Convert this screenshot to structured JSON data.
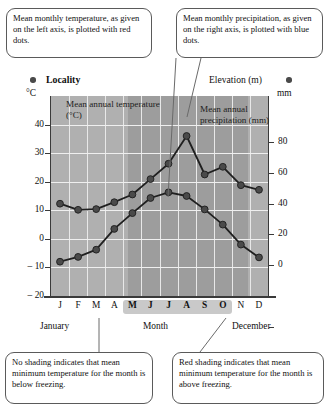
{
  "callouts": {
    "temperature": "Mean monthly temperature, as given on the left axis, is plotted with red dots.",
    "precipitation": "Mean monthly precipitation, as given on the right axis, is plotted with blue dots.",
    "no_shading": "No shading indicates that mean minimum temperature for the month is below freezing.",
    "red_shading": "Red shading indicates that mean minimum temperature for the month is above freezing."
  },
  "header": {
    "locality": "Locality",
    "elevation": "Elevation (m)",
    "left_unit": "°C",
    "right_unit": "mm",
    "left_dot": "red-dot-marker",
    "right_dot": "blue-dot-marker"
  },
  "series_labels": {
    "temperature": "Mean annual temperature (°C)",
    "precipitation": "Mean annual precipitation (mm)"
  },
  "axis_captions": {
    "first": "January",
    "middle": "Month",
    "last": "December"
  },
  "colors": {
    "plot_background": "#b0b0b0",
    "red_shading_band": "#9d9d9d",
    "gridlines": "#e8e8e8",
    "axis": "#3a3a3a",
    "marker": "#4a4a4a",
    "line": "#1f1f1f",
    "callout_border": "#5a5a5a",
    "month_band": "#c9c9c9"
  },
  "chart_data": {
    "type": "line",
    "xlabel": "Month",
    "grid": true,
    "legend": "inline-annotations",
    "categories": [
      "J",
      "F",
      "M",
      "A",
      "M",
      "J",
      "J",
      "A",
      "S",
      "O",
      "N",
      "D"
    ],
    "category_names": [
      "January",
      "February",
      "March",
      "April",
      "May",
      "June",
      "July",
      "August",
      "September",
      "October",
      "November",
      "December"
    ],
    "shaded_months": [
      "M",
      "J",
      "J",
      "A",
      "S",
      "O"
    ],
    "shaded_month_names": [
      "May",
      "June",
      "July",
      "August",
      "September",
      "October"
    ],
    "axes": {
      "left": {
        "label": "°C",
        "ylim": [
          -20,
          50
        ],
        "ticks": [
          40,
          30,
          20,
          10,
          0,
          -10,
          -20
        ],
        "tick_labels": [
          "40",
          "30",
          "20",
          "10",
          "0",
          "– 10",
          "– 20"
        ]
      },
      "right": {
        "label": "mm",
        "ylim": [
          -20,
          110
        ],
        "ticks": [
          80,
          60,
          40,
          20,
          0
        ],
        "tick_labels": [
          "80",
          "60",
          "40",
          "20",
          "0"
        ]
      }
    },
    "series": [
      {
        "name": "Mean annual temperature (°C)",
        "axis": "left",
        "unit": "°C",
        "marker": "red dot",
        "values": [
          -8.0,
          -6.3,
          -3.8,
          3.5,
          9.0,
          14.3,
          16.3,
          15.0,
          10.3,
          5.0,
          -2.0,
          -6.5
        ]
      },
      {
        "name": "Mean annual precipitation (mm)",
        "axis": "right",
        "unit": "mm",
        "marker": "blue dot",
        "values": [
          40,
          36,
          36.5,
          41,
          46,
          56,
          66,
          84,
          59,
          64,
          52,
          49
        ]
      }
    ]
  }
}
